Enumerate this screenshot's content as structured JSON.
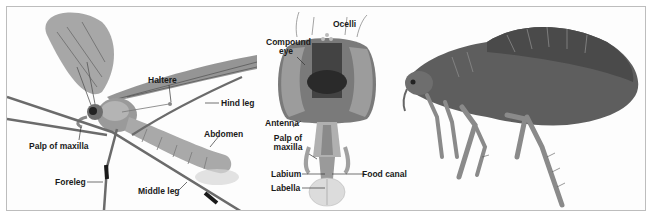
{
  "figure": {
    "panels": [
      {
        "id": "crane-fly",
        "subject": "Crane fly (side view)",
        "labels": {
          "haltere": "Haltere",
          "hind_leg": "Hind leg",
          "abdomen": "Abdomen",
          "palp_of_maxilla": "Palp of maxilla",
          "foreleg": "Foreleg",
          "middle_leg": "Middle leg"
        }
      },
      {
        "id": "fly-head",
        "subject": "Fly head (front view)",
        "labels": {
          "ocelli": "Ocelli",
          "compound_eye_1": "Compound",
          "compound_eye_2": "eye",
          "antenna": "Antenna",
          "palp_1": "Palp of",
          "palp_2": "maxilla",
          "labium": "Labium",
          "labella": "Labella",
          "food_canal": "Food canal"
        }
      },
      {
        "id": "flea",
        "subject": "Flea (side view)",
        "labels": {}
      }
    ],
    "colors": {
      "border": "#bdbdbd",
      "label_text": "#1a1a1a",
      "leader_line": "#333333"
    }
  }
}
